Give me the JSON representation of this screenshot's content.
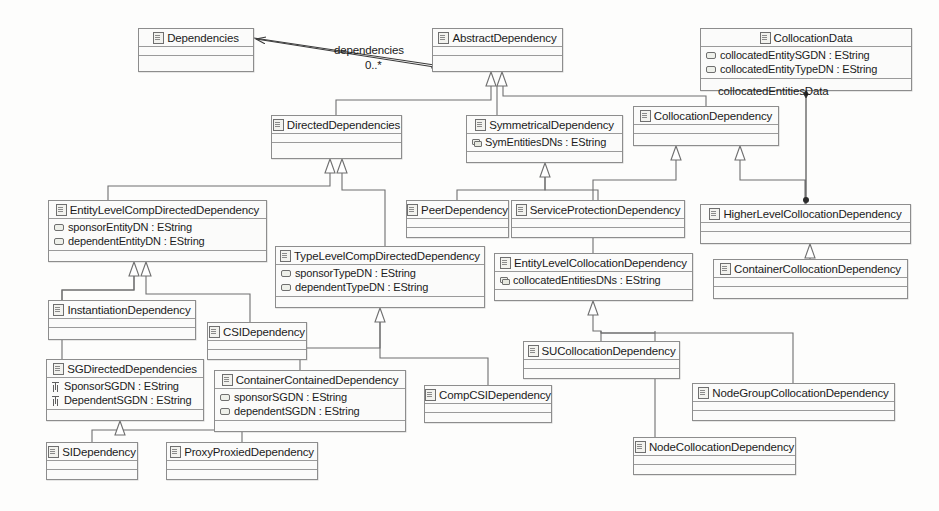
{
  "diagram": {
    "type": "uml-class-diagram",
    "stroke_color": "#6f6f6f",
    "fill_color": "#fbfbfa",
    "text_color": "#1c1c1c"
  },
  "classes": [
    {
      "id": "dependencies",
      "name": "Dependencies",
      "x": 138,
      "y": 28,
      "w": 116,
      "h": 44,
      "attributes": []
    },
    {
      "id": "abstractDependency",
      "name": "AbstractDependency",
      "x": 432,
      "y": 28,
      "w": 131,
      "h": 44,
      "attributes": []
    },
    {
      "id": "collocationData",
      "name": "CollocationData",
      "x": 700,
      "y": 28,
      "w": 212,
      "h": 63,
      "attributes": [
        {
          "text": "collocatedEntitySGDN : EString",
          "icon": "attribute-icon"
        },
        {
          "text": "collocatedEntityTypeDN : EString",
          "icon": "attribute-icon"
        }
      ]
    },
    {
      "id": "directedDependencies",
      "name": "DirectedDependencies",
      "x": 271,
      "y": 115,
      "w": 131,
      "h": 44,
      "attributes": []
    },
    {
      "id": "symmetricalDependency",
      "name": "SymmetricalDependency",
      "x": 466,
      "y": 115,
      "w": 157,
      "h": 48,
      "attributes": [
        {
          "text": "SymEntitiesDNs : EString",
          "icon": "attribute-multi-icon"
        }
      ]
    },
    {
      "id": "collocationDependency",
      "name": "CollocationDependency",
      "x": 633,
      "y": 106,
      "w": 146,
      "h": 40,
      "attributes": []
    },
    {
      "id": "entityLevelCompDirectedDependency",
      "name": "EntityLevelCompDirectedDependency",
      "x": 48,
      "y": 200,
      "w": 219,
      "h": 62,
      "attributes": [
        {
          "text": "sponsorEntityDN : EString",
          "icon": "attribute-icon"
        },
        {
          "text": "dependentEntityDN : EString",
          "icon": "attribute-icon"
        }
      ]
    },
    {
      "id": "peerDependency",
      "name": "PeerDependency",
      "x": 406,
      "y": 200,
      "w": 103,
      "h": 38,
      "attributes": []
    },
    {
      "id": "serviceProtectionDependency",
      "name": "ServiceProtectionDependency",
      "x": 511,
      "y": 200,
      "w": 174,
      "h": 38,
      "attributes": []
    },
    {
      "id": "higherLevelCollocationDependency",
      "name": "HigherLevelCollocationDependency",
      "x": 700,
      "y": 204,
      "w": 211,
      "h": 40,
      "attributes": []
    },
    {
      "id": "typeLevelCompDirectedDependency",
      "name": "TypeLevelCompDirectedDependency",
      "x": 275,
      "y": 246,
      "w": 210,
      "h": 62,
      "attributes": [
        {
          "text": "sponsorTypeDN : EString",
          "icon": "attribute-icon"
        },
        {
          "text": "dependentTypeDN : EString",
          "icon": "attribute-icon"
        }
      ]
    },
    {
      "id": "entityLevelCollocationDependency",
      "name": "EntityLevelCollocationDependency",
      "x": 494,
      "y": 253,
      "w": 199,
      "h": 48,
      "attributes": [
        {
          "text": "collocatedEntitiesDNs : EString",
          "icon": "attribute-multi-icon"
        }
      ]
    },
    {
      "id": "containerCollocationDependency",
      "name": "ContainerCollocationDependency",
      "x": 713,
      "y": 259,
      "w": 195,
      "h": 40,
      "attributes": []
    },
    {
      "id": "instantiationDependency",
      "name": "InstantiationDependency",
      "x": 48,
      "y": 300,
      "w": 148,
      "h": 40,
      "attributes": []
    },
    {
      "id": "csiDependency",
      "name": "CSIDependency",
      "x": 207,
      "y": 322,
      "w": 100,
      "h": 38,
      "attributes": []
    },
    {
      "id": "suCollocationDependency",
      "name": "SUCollocationDependency",
      "x": 523,
      "y": 341,
      "w": 157,
      "h": 38,
      "attributes": []
    },
    {
      "id": "sgDirectedDependencies",
      "name": "SGDirectedDependencies",
      "x": 46,
      "y": 359,
      "w": 158,
      "h": 62,
      "attributes": [
        {
          "text": "SponsorSGDN : EString",
          "icon": "attribute-key-icon"
        },
        {
          "text": "DependentSGDN : EString",
          "icon": "attribute-key-icon"
        }
      ]
    },
    {
      "id": "containerContainedDependency",
      "name": "ContainerContainedDependency",
      "x": 214,
      "y": 370,
      "w": 192,
      "h": 62,
      "attributes": [
        {
          "text": "sponsorSGDN : EString",
          "icon": "attribute-icon"
        },
        {
          "text": "dependentSGDN : EString",
          "icon": "attribute-icon"
        }
      ]
    },
    {
      "id": "nodeGroupCollocationDependency",
      "name": "NodeGroupCollocationDependency",
      "x": 692,
      "y": 383,
      "w": 203,
      "h": 38,
      "attributes": []
    },
    {
      "id": "compCSIDependency",
      "name": "CompCSIDependency",
      "x": 424,
      "y": 385,
      "w": 128,
      "h": 38,
      "attributes": []
    },
    {
      "id": "nodeCollocationDependency",
      "name": "NodeCollocationDependency",
      "x": 633,
      "y": 437,
      "w": 163,
      "h": 38,
      "attributes": []
    },
    {
      "id": "siDependency",
      "name": "SIDependency",
      "x": 46,
      "y": 442,
      "w": 92,
      "h": 38,
      "attributes": []
    },
    {
      "id": "proxyProxiedDependency",
      "name": "ProxyProxiedDependency",
      "x": 166,
      "y": 442,
      "w": 152,
      "h": 38,
      "attributes": []
    }
  ],
  "edge_labels": [
    {
      "id": "dependencies-role",
      "text": "dependencies",
      "x": 334,
      "y": 44
    },
    {
      "id": "dependencies-multiplicity",
      "text": "0..*",
      "x": 365,
      "y": 59
    },
    {
      "id": "collocated-entities-data-role",
      "text": "collocatedEntitiesData",
      "x": 718,
      "y": 85
    }
  ],
  "relationships": [
    {
      "from": "abstractDependency",
      "to": "dependencies",
      "type": "association",
      "role": "dependencies",
      "multiplicity": "0..*"
    },
    {
      "from": "directedDependencies",
      "to": "abstractDependency",
      "type": "generalization"
    },
    {
      "from": "symmetricalDependency",
      "to": "abstractDependency",
      "type": "generalization"
    },
    {
      "from": "collocationDependency",
      "to": "abstractDependency",
      "type": "generalization"
    },
    {
      "from": "entityLevelCompDirectedDependency",
      "to": "directedDependencies",
      "type": "generalization"
    },
    {
      "from": "typeLevelCompDirectedDependency",
      "to": "directedDependencies",
      "type": "generalization"
    },
    {
      "from": "peerDependency",
      "to": "symmetricalDependency",
      "type": "generalization"
    },
    {
      "from": "serviceProtectionDependency",
      "to": "symmetricalDependency",
      "type": "generalization"
    },
    {
      "from": "entityLevelCollocationDependency",
      "to": "collocationDependency",
      "type": "generalization"
    },
    {
      "from": "higherLevelCollocationDependency",
      "to": "collocationDependency",
      "type": "generalization"
    },
    {
      "from": "containerCollocationDependency",
      "to": "higherLevelCollocationDependency",
      "type": "generalization"
    },
    {
      "from": "instantiationDependency",
      "to": "entityLevelCompDirectedDependency",
      "type": "generalization"
    },
    {
      "from": "csiDependency",
      "to": "entityLevelCompDirectedDependency",
      "type": "generalization"
    },
    {
      "from": "sgDirectedDependencies",
      "to": "entityLevelCompDirectedDependency",
      "type": "generalization"
    },
    {
      "from": "containerContainedDependency",
      "to": "typeLevelCompDirectedDependency",
      "type": "generalization"
    },
    {
      "from": "compCSIDependency",
      "to": "typeLevelCompDirectedDependency",
      "type": "generalization"
    },
    {
      "from": "siDependency",
      "to": "sgDirectedDependencies",
      "type": "generalization"
    },
    {
      "from": "proxyProxiedDependency",
      "to": "sgDirectedDependencies",
      "type": "generalization"
    },
    {
      "from": "suCollocationDependency",
      "to": "entityLevelCollocationDependency",
      "type": "generalization"
    },
    {
      "from": "nodeGroupCollocationDependency",
      "to": "entityLevelCollocationDependency",
      "type": "generalization"
    },
    {
      "from": "nodeCollocationDependency",
      "to": "entityLevelCollocationDependency",
      "type": "generalization"
    },
    {
      "from": "collocationData",
      "to": "higherLevelCollocationDependency",
      "type": "composition",
      "role": "collocatedEntitiesData"
    }
  ]
}
